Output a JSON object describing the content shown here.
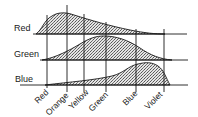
{
  "diagram": {
    "rows": [
      {
        "label": "Red",
        "baseline_y": 34
      },
      {
        "label": "Green",
        "baseline_y": 60
      },
      {
        "label": "Blue",
        "baseline_y": 85
      }
    ],
    "columns": [
      {
        "label": "Red",
        "x": 47
      },
      {
        "label": "Orange",
        "x": 67
      },
      {
        "label": "Yellow",
        "x": 84
      },
      {
        "label": "Green",
        "x": 106
      },
      {
        "label": "Blue",
        "x": 136
      },
      {
        "label": "Violet",
        "x": 164
      }
    ],
    "fill_style": "stippled",
    "colors": {
      "ink": "#1a1a1a",
      "fill": "#bdbdbd",
      "background": "#ffffff"
    }
  }
}
